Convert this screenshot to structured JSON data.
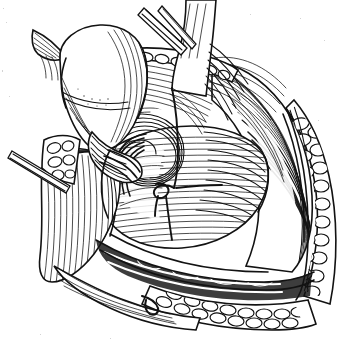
{
  "figure": {
    "kind": "surgical-line-drawing",
    "title": "",
    "caption": "",
    "style": "pen-and-ink hatched medical illustration",
    "background_color": "#ffffff",
    "ink_color": "#121212",
    "canvas": {
      "width": 337,
      "height": 344
    },
    "labels": []
  },
  "structures": [
    {
      "id": "retracted-flap",
      "name": "Retracted tissue flap (upper left bulbous mass)"
    },
    {
      "id": "flap-tip",
      "name": "Pointed cut edge of flap"
    },
    {
      "id": "cord-structure",
      "name": "Pale vertical cord / tendon band at top"
    },
    {
      "id": "whorl",
      "name": "Concentric whorl (deep ring)"
    },
    {
      "id": "muscle-fibers-right",
      "name": "Sweeping muscle fiber bundles, right"
    },
    {
      "id": "muscle-fibers-floor",
      "name": "Horizontal fiber floor of wound"
    },
    {
      "id": "wound-edge-right",
      "name": "Everted wound edge, right"
    },
    {
      "id": "wound-edge-bottom",
      "name": "Everted wound edge, bottom"
    },
    {
      "id": "fat-lobules",
      "name": "Subcutaneous fat lobules (cobblestone)"
    },
    {
      "id": "deep-shadow",
      "name": "Dark deep recess shadow, left"
    },
    {
      "id": "suture",
      "name": "Suture thread with tied knot"
    },
    {
      "id": "retractor-top",
      "name": "Retractor blade entering from top"
    },
    {
      "id": "retractor-left",
      "name": "Retractor blade entering from left"
    }
  ],
  "annotations": {
    "visible_text": "none",
    "arrows": 0,
    "leader_lines": 0
  }
}
